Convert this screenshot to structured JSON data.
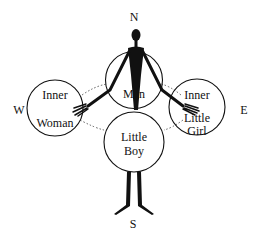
{
  "compass": {
    "north": "N",
    "south": "S",
    "west": "W",
    "east": "E"
  },
  "circles": {
    "top": {
      "label": "Man"
    },
    "left": {
      "line1": "Inner",
      "line2": "Woman"
    },
    "right": {
      "line1": "Inner",
      "line2": "Little",
      "line3": "Girl"
    },
    "bottom": {
      "line1": "Little",
      "line2": "Boy"
    }
  },
  "colors": {
    "ink": "#111111",
    "background": "#ffffff"
  }
}
